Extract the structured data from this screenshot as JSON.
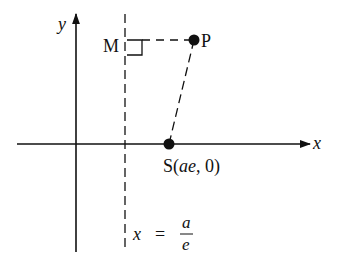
{
  "diagram": {
    "axes": {
      "x_label": "x",
      "y_label": "y"
    },
    "points": {
      "P": {
        "label": "P"
      },
      "S": {
        "label_prefix": "S(",
        "label_var": "ae",
        "label_suffix": ", 0)"
      },
      "M": {
        "label": "M"
      }
    },
    "directrix": {
      "lhs": "x",
      "eq": "=",
      "numerator": "a",
      "denominator": "e"
    },
    "colors": {
      "ink": "#111111",
      "background": "#ffffff"
    }
  }
}
